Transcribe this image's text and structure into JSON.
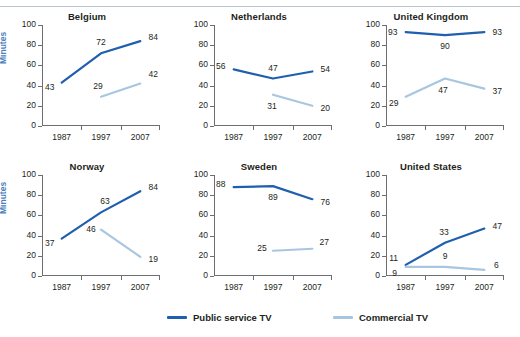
{
  "figure": {
    "ylabel": "Minutes",
    "categories": [
      "1987",
      "1997",
      "2007"
    ],
    "yticks": [
      "0",
      "20",
      "40",
      "60",
      "80",
      "100"
    ],
    "ylim": [
      0,
      100
    ]
  },
  "legend": {
    "position": "bottom-center",
    "items": [
      {
        "label": "Public service TV",
        "color": "#1f5fad",
        "name": "legend-public-service-tv"
      },
      {
        "label": "Commercial TV",
        "color": "#a8c6e0",
        "name": "legend-commercial-tv"
      }
    ]
  },
  "colors": {
    "public_service": "#1f5fad",
    "commercial": "#a8c6e0",
    "axis": "#6d6e71",
    "text": "#231f20",
    "ylabel": "#4a7ebb"
  },
  "chart_data": [
    {
      "type": "line",
      "title": "Belgium",
      "xlabel": "",
      "ylabel": "Minutes",
      "ylim": [
        0,
        100
      ],
      "grid": false,
      "categories": [
        "1987",
        "1997",
        "2007"
      ],
      "series": [
        {
          "name": "Public service TV",
          "color": "#1f5fad",
          "values": [
            43,
            72,
            84
          ]
        },
        {
          "name": "Commercial TV",
          "color": "#a8c6e0",
          "values": [
            null,
            29,
            42
          ]
        }
      ]
    },
    {
      "type": "line",
      "title": "Netherlands",
      "xlabel": "",
      "ylabel": "",
      "ylim": [
        0,
        100
      ],
      "grid": false,
      "categories": [
        "1987",
        "1997",
        "2007"
      ],
      "series": [
        {
          "name": "Public service TV",
          "color": "#1f5fad",
          "values": [
            56,
            47,
            54
          ]
        },
        {
          "name": "Commercial TV",
          "color": "#a8c6e0",
          "values": [
            null,
            31,
            20
          ]
        }
      ]
    },
    {
      "type": "line",
      "title": "United Kingdom",
      "xlabel": "",
      "ylabel": "",
      "ylim": [
        0,
        100
      ],
      "grid": false,
      "categories": [
        "1987",
        "1997",
        "2007"
      ],
      "series": [
        {
          "name": "Public service TV",
          "color": "#1f5fad",
          "values": [
            93,
            90,
            93
          ]
        },
        {
          "name": "Commercial TV",
          "color": "#a8c6e0",
          "values": [
            29,
            47,
            37
          ]
        }
      ]
    },
    {
      "type": "line",
      "title": "Norway",
      "xlabel": "",
      "ylabel": "Minutes",
      "ylim": [
        0,
        100
      ],
      "grid": false,
      "categories": [
        "1987",
        "1997",
        "2007"
      ],
      "series": [
        {
          "name": "Public service TV",
          "color": "#1f5fad",
          "values": [
            37,
            63,
            84
          ]
        },
        {
          "name": "Commercial TV",
          "color": "#a8c6e0",
          "values": [
            null,
            46,
            19
          ]
        }
      ]
    },
    {
      "type": "line",
      "title": "Sweden",
      "xlabel": "",
      "ylabel": "",
      "ylim": [
        0,
        100
      ],
      "grid": false,
      "categories": [
        "1987",
        "1997",
        "2007"
      ],
      "series": [
        {
          "name": "Public service TV",
          "color": "#1f5fad",
          "values": [
            88,
            89,
            76
          ]
        },
        {
          "name": "Commercial TV",
          "color": "#a8c6e0",
          "values": [
            null,
            25,
            27
          ]
        }
      ]
    },
    {
      "type": "line",
      "title": "United States",
      "xlabel": "",
      "ylabel": "",
      "ylim": [
        0,
        100
      ],
      "grid": false,
      "categories": [
        "1987",
        "1997",
        "2007"
      ],
      "series": [
        {
          "name": "Public service TV",
          "color": "#1f5fad",
          "values": [
            11,
            33,
            47
          ]
        },
        {
          "name": "Commercial TV",
          "color": "#a8c6e0",
          "values": [
            9,
            9,
            6
          ]
        }
      ]
    }
  ],
  "label_offsets": {
    "Belgium": {
      "Public service TV": [
        [
          -12,
          4
        ],
        [
          0,
          -11
        ],
        [
          13,
          -4
        ]
      ],
      "Commercial TV": [
        [
          0,
          0
        ],
        [
          -3,
          -11
        ],
        [
          13,
          -10
        ]
      ]
    },
    "Netherlands": {
      "Public service TV": [
        [
          -13,
          -3
        ],
        [
          0,
          -11
        ],
        [
          13,
          -2
        ]
      ],
      "Commercial TV": [
        [
          0,
          0
        ],
        [
          -1,
          11
        ],
        [
          13,
          2
        ]
      ]
    },
    "United Kingdom": {
      "Public service TV": [
        [
          -13,
          0
        ],
        [
          0,
          11
        ],
        [
          13,
          0
        ]
      ],
      "Commercial TV": [
        [
          -12,
          6
        ],
        [
          -2,
          11
        ],
        [
          13,
          2
        ]
      ]
    },
    "Norway": {
      "Public service TV": [
        [
          -12,
          4
        ],
        [
          4,
          -11
        ],
        [
          13,
          -4
        ]
      ],
      "Commercial TV": [
        [
          0,
          0
        ],
        [
          -10,
          -1
        ],
        [
          13,
          2
        ]
      ]
    },
    "Sweden": {
      "Public service TV": [
        [
          -13,
          -3
        ],
        [
          0,
          11
        ],
        [
          13,
          3
        ]
      ],
      "Commercial TV": [
        [
          0,
          0
        ],
        [
          -11,
          -3
        ],
        [
          12,
          -7
        ]
      ]
    },
    "United States": {
      "Public service TV": [
        [
          -12,
          -7
        ],
        [
          -1,
          -11
        ],
        [
          13,
          -3
        ]
      ],
      "Commercial TV": [
        [
          -11,
          6
        ],
        [
          0,
          -11
        ],
        [
          12,
          -5
        ]
      ]
    }
  }
}
